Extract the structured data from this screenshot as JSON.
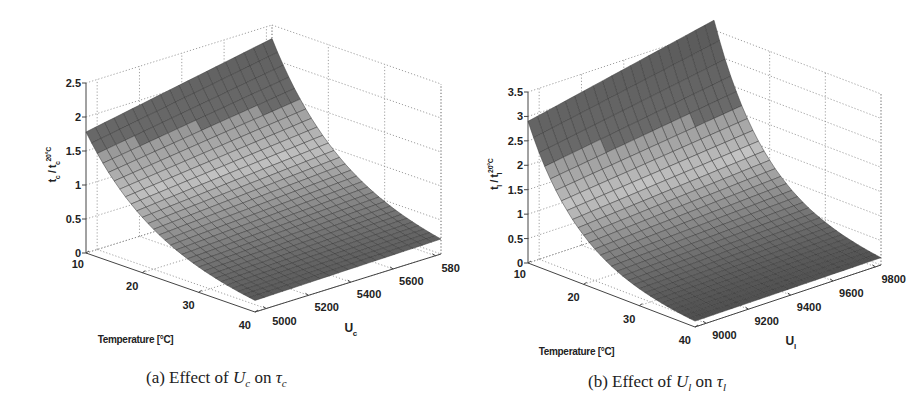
{
  "chart_data": [
    {
      "type": "surface",
      "panel": "a",
      "caption": {
        "prefix": "(a) Effect of ",
        "var": "U",
        "var_sub": "c",
        "mid": " on ",
        "target": "τ",
        "target_sub": "c"
      },
      "xlabel": "Temperature [°C]",
      "ylabel": "U",
      "ylabel_sub": "c",
      "zlabel": "τc / τc^20°C",
      "zlabel_display": "t_c / t_c^20°C",
      "x_ticks": [
        "10",
        "20",
        "30",
        "40"
      ],
      "y_ticks": [
        "5000",
        "5200",
        "5400",
        "5600",
        "5800"
      ],
      "z_ticks": [
        "0",
        "0.5",
        "1",
        "1.5",
        "2",
        "2.5"
      ],
      "xlim": [
        10,
        40
      ],
      "ylim": [
        4900,
        5850
      ],
      "zlim": [
        0,
        2.5
      ],
      "grid": true,
      "colormap": "gray",
      "corner_values": {
        "T10_Umin": 1.78,
        "T10_Umax": 2.3,
        "T40_Umin": 0.17,
        "T40_Umax": 0.22
      },
      "grid_resolution": [
        30,
        20
      ]
    },
    {
      "type": "surface",
      "panel": "b",
      "caption": {
        "prefix": "(b) Effect of ",
        "var": "U",
        "var_sub": "l",
        "mid": " on ",
        "target": "τ",
        "target_sub": "l"
      },
      "xlabel": "Temperature [°C]",
      "ylabel": "U",
      "ylabel_sub": "l",
      "zlabel": "τl / τl^20°C",
      "zlabel_display": "t_l / t_l^20°C",
      "x_ticks": [
        "10",
        "20",
        "30",
        "40"
      ],
      "y_ticks": [
        "9000",
        "9200",
        "9400",
        "9600",
        "9800"
      ],
      "z_ticks": [
        "0",
        "0.5",
        "1",
        "1.5",
        "2",
        "2.5",
        "3",
        "3.5"
      ],
      "xlim": [
        10,
        40
      ],
      "ylim": [
        8900,
        9850
      ],
      "zlim": [
        0,
        3.5
      ],
      "grid": true,
      "colormap": "gray",
      "corner_values": {
        "T10_Umin": 2.9,
        "T10_Umax": 3.7,
        "T40_Umin": 0.12,
        "T40_Umax": 0.15
      },
      "grid_resolution": [
        30,
        20
      ]
    }
  ],
  "panels": {
    "a": {
      "caption_prefix": "(a) Effect of ",
      "caption_var": "U",
      "caption_var_sub": "c",
      "caption_mid": " on ",
      "caption_target": "τ",
      "caption_target_sub": "c",
      "xlabel": "Temperature [°C]",
      "ylabel": "U",
      "ylabel_sub": "c",
      "zlabel_main": "t",
      "zlabel_sub": "c",
      "zlabel_sep": " / t",
      "zlabel_sup": "20°C",
      "x_ticks": [
        "10",
        "20",
        "30",
        "40"
      ],
      "y_ticks": [
        "5000",
        "5200",
        "5400",
        "5600",
        "5800"
      ],
      "z_ticks": [
        "0",
        "0.5",
        "1",
        "1.5",
        "2",
        "2.5"
      ]
    },
    "b": {
      "caption_prefix": "(b) Effect of ",
      "caption_var": "U",
      "caption_var_sub": "l",
      "caption_mid": " on ",
      "caption_target": "τ",
      "caption_target_sub": "l",
      "xlabel": "Temperature [°C]",
      "ylabel": "U",
      "ylabel_sub": "l",
      "zlabel_main": "t",
      "zlabel_sub": "l",
      "zlabel_sep": " / t",
      "zlabel_sup": "20°C",
      "x_ticks": [
        "10",
        "20",
        "30",
        "40"
      ],
      "y_ticks": [
        "9000",
        "9200",
        "9400",
        "9600",
        "9800"
      ],
      "z_ticks": [
        "0",
        "0.5",
        "1",
        "1.5",
        "2",
        "2.5",
        "3",
        "3.5"
      ]
    }
  },
  "colors": {
    "surface_dark": "#5a5a5a",
    "surface_mid": "#8c8c8c",
    "surface_light": "#c4c4c4",
    "mesh_line": "#3a3a3a",
    "axis": "#444444",
    "grid": "#888888"
  }
}
